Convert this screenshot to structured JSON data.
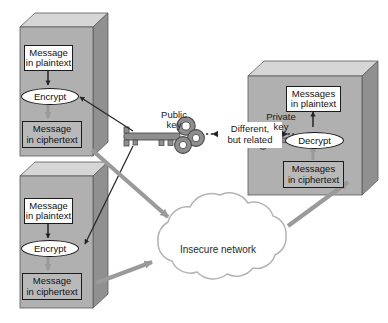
{
  "diagram": {
    "senders": [
      {
        "id": "sender-top",
        "plaintext_label_line1": "Message",
        "plaintext_label_line2": "in plaintext",
        "process_label": "Encrypt",
        "ciphertext_label_line1": "Message",
        "ciphertext_label_line2": "in ciphertext"
      },
      {
        "id": "sender-bottom",
        "plaintext_label_line1": "Message",
        "plaintext_label_line2": "in plaintext",
        "process_label": "Encrypt",
        "ciphertext_label_line1": "Message",
        "ciphertext_label_line2": "in ciphertext"
      }
    ],
    "receiver": {
      "id": "receiver",
      "plaintext_label_line1": "Messages",
      "plaintext_label_line2": "in plaintext",
      "process_label": "Decrypt",
      "ciphertext_label_line1": "Messages",
      "ciphertext_label_line2": "in ciphertext"
    },
    "keys": {
      "public": {
        "label_line1": "Public",
        "label_line2": "key",
        "icon": "key-icon"
      },
      "private": {
        "label_line1": "Private",
        "label_line2": "key",
        "icon": "key-icon"
      },
      "relation_line1": "Different,",
      "relation_line2": "but related"
    },
    "network": {
      "label": "Insecure network",
      "icon": "cloud-icon"
    },
    "colors": {
      "box_front": "#b0b0b0",
      "box_top": "#d6d6d6",
      "box_side": "#909090",
      "ciphertext_fill": "#b9b9b9",
      "plaintext_fill": "#ffffff",
      "arrow_gray": "#9a9a9a",
      "arrow_dark": "#262626",
      "key_gray": "#8e8e8e",
      "cloud_stroke": "#b4b4b4",
      "outline": "#1b1b1b"
    }
  }
}
